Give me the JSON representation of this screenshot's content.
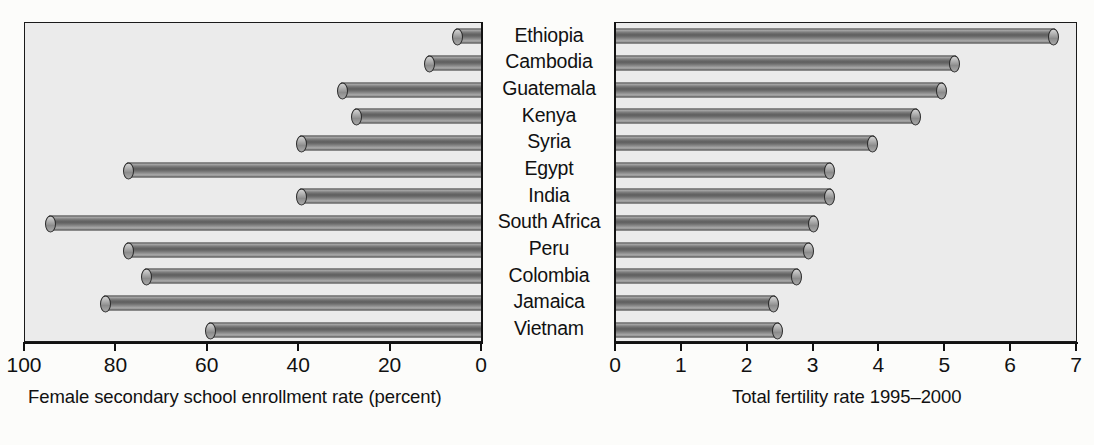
{
  "chart_data": {
    "type": "bar",
    "title": "",
    "subtitle": "",
    "orientation": "horizontal",
    "layout": "back-to-back paired bar chart (butterfly / tornado)",
    "categories": [
      "Ethiopia",
      "Cambodia",
      "Guatemala",
      "Kenya",
      "Syria",
      "Egypt",
      "India",
      "South Africa",
      "Peru",
      "Colombia",
      "Jamaica",
      "Vietnam"
    ],
    "panels": [
      {
        "id": "left",
        "xlabel": "Female secondary school enrollment rate (percent)",
        "ylabel": "",
        "xlim": [
          100,
          0
        ],
        "reversed": true,
        "ticks": [
          100,
          80,
          60,
          40,
          20,
          0
        ],
        "tick_labels": [
          "100",
          "80",
          "60",
          "40",
          "20",
          "0"
        ],
        "grid": false,
        "series": [
          {
            "name": "Female secondary school enrollment rate (percent)",
            "values": [
              6,
              12,
              31,
              28,
              40,
              78,
              40,
              95,
              78,
              74,
              83,
              60
            ]
          }
        ]
      },
      {
        "id": "right",
        "xlabel": "Total fertility rate 1995–2000",
        "ylabel": "",
        "xlim": [
          0,
          7
        ],
        "reversed": false,
        "ticks": [
          0,
          1,
          2,
          3,
          4,
          5,
          6,
          7
        ],
        "tick_labels": [
          "0",
          "1",
          "2",
          "3",
          "4",
          "5",
          "6",
          "7"
        ],
        "grid": false,
        "series": [
          {
            "name": "Total fertility rate 1995–2000",
            "values": [
              6.7,
              5.2,
              5.0,
              4.6,
              3.95,
              3.3,
              3.3,
              3.05,
              2.98,
              2.8,
              2.45,
              2.5
            ]
          }
        ]
      }
    ],
    "colors": {
      "bar_fill_light": "#b9b9b9",
      "bar_fill_dark": "#5e5e5e",
      "bar_outline": "#2b2b2b",
      "plot_background": "#ebebeb",
      "page_background": "#fcfcfa",
      "text": "#111111",
      "axis": "#121212"
    }
  }
}
